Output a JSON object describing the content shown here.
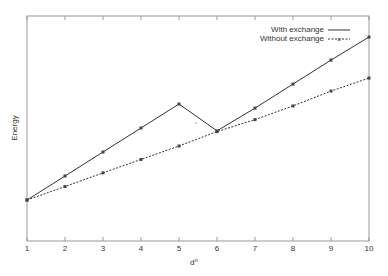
{
  "chart_data": {
    "type": "line",
    "title": "",
    "xlabel": "d^n",
    "ylabel": "Energy",
    "x": [
      1,
      2,
      3,
      4,
      5,
      6,
      7,
      8,
      9,
      10
    ],
    "xlim": [
      1,
      10
    ],
    "ylim": [
      -1.7,
      7.7
    ],
    "grid": false,
    "legend_position": "top-right",
    "series": [
      {
        "name": "With exchange",
        "style": "solid",
        "marker": "+",
        "values": [
          0,
          1.0,
          2.0,
          3.0,
          4.0,
          2.88,
          3.83,
          4.83,
          5.83,
          6.79
        ]
      },
      {
        "name": "Without exchange",
        "style": "dashed",
        "marker": "x",
        "values": [
          0,
          0.56,
          1.13,
          1.69,
          2.25,
          2.85,
          3.35,
          3.92,
          4.54,
          5.08
        ]
      }
    ],
    "xticks": [
      "1",
      "2",
      "3",
      "4",
      "5",
      "6",
      "7",
      "8",
      "9",
      "10"
    ]
  },
  "labels": {
    "xlabel": "d",
    "xlabel_sup": "n",
    "ylabel": "Energy"
  },
  "legend": [
    "With exchange",
    "Without exchange"
  ]
}
